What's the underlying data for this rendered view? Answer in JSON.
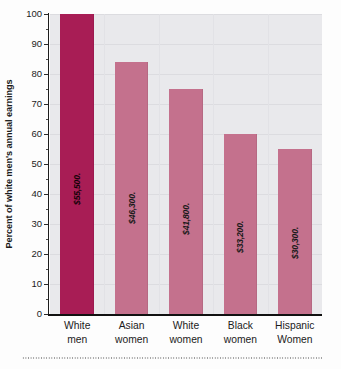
{
  "chart_data": {
    "type": "bar",
    "title": "",
    "subtitle": "",
    "xlabel": "",
    "ylabel": "Percent of white men's annual earnings",
    "ylim": [
      0,
      100
    ],
    "ytick_labels": [
      "0",
      "10",
      "20",
      "30",
      "40",
      "50",
      "60",
      "70",
      "80",
      "90",
      "100"
    ],
    "ytick_values": [
      0,
      10,
      20,
      30,
      40,
      50,
      60,
      70,
      80,
      90,
      100
    ],
    "minor_tick_interval": 5,
    "grid": true,
    "legend": "none",
    "categories": [
      "White men",
      "Asian women",
      "White women",
      "Black women",
      "Hispanic Women"
    ],
    "category_lines": [
      {
        "line1": "White",
        "line2": "men"
      },
      {
        "line1": "Asian",
        "line2": "women"
      },
      {
        "line1": "White",
        "line2": "women"
      },
      {
        "line1": "Black",
        "line2": "women"
      },
      {
        "line1": "Hispanic",
        "line2": "Women"
      }
    ],
    "values": [
      100,
      84,
      75,
      60,
      55
    ],
    "data_labels": [
      "$55,500.",
      "$46,300.",
      "$41,800.",
      "$33,200.",
      "$30,300."
    ],
    "bar_colors": [
      "#a81d55",
      "#c4718d",
      "#c4718d",
      "#c4718d",
      "#c4718d"
    ],
    "highlight_index": 0,
    "plot_background": "#e9e9ec",
    "gridline_color": "#dcdce0",
    "axis_color": "#111111"
  },
  "colors": {
    "accent_primary": "#a81d55",
    "accent_secondary": "#c4718d",
    "plot_bg": "#e9e9ec",
    "text": "#1b1b1b"
  }
}
